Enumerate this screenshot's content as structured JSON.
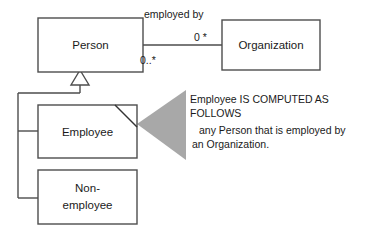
{
  "diagram": {
    "type": "uml-class-diagram",
    "classes": [
      {
        "id": "person",
        "name": "Person"
      },
      {
        "id": "organization",
        "name": "Organization"
      },
      {
        "id": "employee",
        "name": "Employee"
      },
      {
        "id": "nonemployee_line1",
        "name": "Non-"
      },
      {
        "id": "nonemployee_line2",
        "name": "employee"
      }
    ],
    "association": {
      "name": "employed by",
      "source_multiplicity": "0..*",
      "target_multiplicity": "0 *"
    },
    "note": {
      "line1": "Employee IS COMPUTED AS",
      "line2": "FOLLOWS",
      "line3": "any Person that is employed by",
      "line4": "an Organization."
    },
    "colors": {
      "stroke": "#4d4d4d",
      "text": "#1a1a1a",
      "note_arrow": "#a8a8a8",
      "background": "#ffffff"
    }
  }
}
